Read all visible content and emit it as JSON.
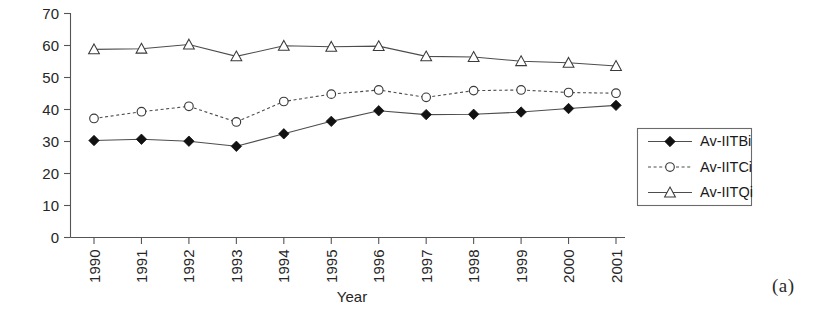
{
  "chart_data": {
    "type": "line",
    "title": "",
    "subtitle": "",
    "xlabel": "Year",
    "ylabel": "",
    "categories": [
      "1990",
      "1991",
      "1992",
      "1993",
      "1994",
      "1995",
      "1996",
      "1997",
      "1998",
      "1999",
      "2000",
      "2001"
    ],
    "x": [
      1990,
      1991,
      1992,
      1993,
      1994,
      1995,
      1996,
      1997,
      1998,
      1999,
      2000,
      2001
    ],
    "xtick_labels": [
      "1990",
      "1991",
      "1992",
      "1993",
      "1994",
      "1995",
      "1996",
      "1997",
      "1998",
      "1999",
      "2000",
      "2001"
    ],
    "ytick_labels": [
      "0",
      "10",
      "20",
      "30",
      "40",
      "50",
      "60",
      "70"
    ],
    "yticks": [
      0,
      10,
      20,
      30,
      40,
      50,
      60,
      70
    ],
    "ylim": [
      0,
      70
    ],
    "grid": false,
    "legend_position": "right",
    "series": [
      {
        "name": "Av-IITBi",
        "marker": "filled-diamond",
        "linestyle": "solid",
        "color": "#111111",
        "values": [
          30.3,
          30.7,
          30.1,
          28.5,
          32.4,
          36.3,
          39.6,
          38.4,
          38.5,
          39.2,
          40.3,
          41.3
        ]
      },
      {
        "name": "Av-IITCi",
        "marker": "open-circle",
        "linestyle": "dotted",
        "color": "#3a3a3a",
        "values": [
          37.2,
          39.3,
          41.0,
          36.1,
          42.5,
          44.8,
          46.1,
          43.8,
          45.9,
          46.1,
          45.3,
          45.1
        ]
      },
      {
        "name": "Av-IITQi",
        "marker": "open-triangle",
        "linestyle": "solid",
        "color": "#3a3a3a",
        "values": [
          58.8,
          59.0,
          60.3,
          56.6,
          59.9,
          59.6,
          59.8,
          56.6,
          56.4,
          55.1,
          54.6,
          53.6
        ]
      }
    ]
  },
  "legend": {
    "entries": [
      {
        "label": "Av-IITBi"
      },
      {
        "label": "Av-IITCi"
      },
      {
        "label": "Av-IITQi"
      }
    ]
  },
  "caption": {
    "panel_label": "(a)"
  },
  "colors": {
    "axis": "#555555",
    "line": "#4d4d4d",
    "marker_fill_dark": "#111111",
    "marker_fill_light": "#ffffff",
    "text": "#262626",
    "background": "#ffffff"
  }
}
